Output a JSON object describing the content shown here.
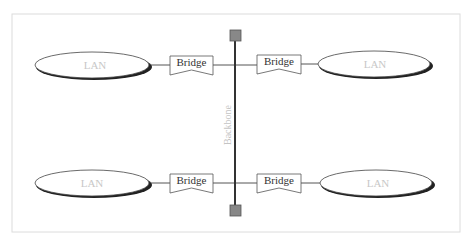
{
  "diagram": {
    "title": "",
    "backbone": {
      "label": "Backbone",
      "x": 235,
      "y_top": 40,
      "y_bottom": 205,
      "color": "#333333",
      "terminator_color": "#888888"
    },
    "lans": [
      {
        "id": "lan-top-left",
        "label": "LAN",
        "cx": 93,
        "cy": 65
      },
      {
        "id": "lan-top-right",
        "label": "LAN",
        "cx": 375,
        "cy": 64
      },
      {
        "id": "lan-bottom-left",
        "label": "LAN",
        "cx": 93,
        "cy": 184
      },
      {
        "id": "lan-bottom-right",
        "label": "LAN",
        "cx": 375,
        "cy": 183
      }
    ],
    "bridges": [
      {
        "id": "bridge-top-left",
        "label": "Bridge",
        "x": 170,
        "y": 55
      },
      {
        "id": "bridge-top-right",
        "label": "Bridge",
        "x": 257,
        "y": 55
      },
      {
        "id": "bridge-bottom-left",
        "label": "Bridge",
        "x": 170,
        "y": 173
      },
      {
        "id": "bridge-bottom-right",
        "label": "Bridge",
        "x": 257,
        "y": 173
      }
    ],
    "frame": {
      "x": 12,
      "y": 14,
      "width": 448,
      "height": 218,
      "color": "#dcdcdc"
    }
  }
}
